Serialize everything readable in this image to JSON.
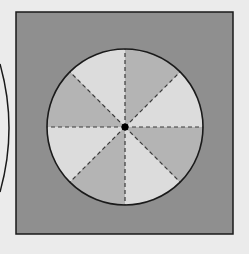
{
  "figure": {
    "background_color": "#ebebeb",
    "square": {
      "x": 16,
      "y": 12,
      "width": 217,
      "height": 222,
      "fill": "#8f8f8f",
      "stroke": "#1a1a1a"
    },
    "circle": {
      "cx": 125,
      "cy": 127,
      "r": 78,
      "stroke": "#1a1a1a",
      "sector_count": 8,
      "sector_colors": [
        "#b4b4b4",
        "#dcdcdc"
      ],
      "divider_style": "dashed",
      "divider_color": "#3a3a3a"
    },
    "center_point": {
      "cx": 125,
      "cy": 127,
      "r": 3.5,
      "fill": "#000000"
    },
    "partial_outer_arc": {
      "description": "portion of a larger circle visible at left edge",
      "stroke": "#1a1a1a"
    }
  }
}
